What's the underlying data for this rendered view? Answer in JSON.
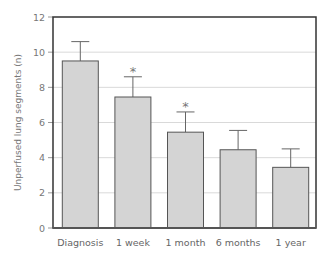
{
  "chart_data": {
    "type": "bar",
    "title": "",
    "xlabel": "",
    "ylabel": "Unperfused lung segments (n)",
    "ylim": [
      0,
      12
    ],
    "yticks": [
      0,
      2,
      4,
      6,
      8,
      10,
      12
    ],
    "grid": true,
    "legend": null,
    "categories": [
      "Diagnosis",
      "1 week",
      "1 month",
      "6 months",
      "1 year"
    ],
    "values": [
      9.5,
      7.45,
      5.45,
      4.45,
      3.45
    ],
    "error_upper": [
      10.6,
      8.6,
      6.6,
      5.55,
      4.5
    ],
    "annotations": [
      {
        "category": "1 week",
        "text": "*"
      },
      {
        "category": "1 month",
        "text": "*"
      }
    ]
  },
  "style": {
    "bar_fill": "#d4d4d4",
    "bar_stroke": "#555555",
    "grid_color": "#d9d9d9",
    "frame_color": "#333333",
    "error_color": "#666666"
  }
}
